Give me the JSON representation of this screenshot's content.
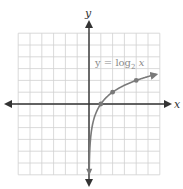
{
  "chart_data": {
    "type": "line",
    "title": "",
    "function": "y = log2 x",
    "xlabel": "x",
    "ylabel": "y",
    "xlim": [
      -6,
      6
    ],
    "ylim": [
      -6,
      6
    ],
    "grid": true,
    "grid_step": 1,
    "series": [
      {
        "name": "y = log2 x",
        "points": [
          {
            "x": 1,
            "y": 0
          },
          {
            "x": 2,
            "y": 1
          },
          {
            "x": 4,
            "y": 2
          }
        ]
      }
    ],
    "annotation": {
      "text_main": "y = log",
      "text_sub": "2",
      "text_var": " x"
    }
  },
  "labels": {
    "x_axis": "x",
    "y_axis": "y"
  },
  "colors": {
    "grid": "#d0d0d0",
    "axes": "#333333",
    "curve": "#7a7a7a",
    "label": "#8a8a8a"
  }
}
